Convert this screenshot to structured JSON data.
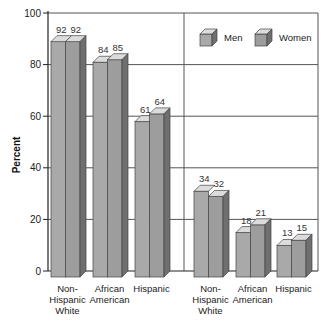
{
  "chart_data": {
    "type": "bar",
    "title": "",
    "xlabel": "",
    "ylabel": "Percent",
    "ylim": [
      0,
      100
    ],
    "yticks": [
      0,
      20,
      40,
      60,
      80,
      100
    ],
    "grid": true,
    "legend_position": "upper right",
    "groups": [
      {
        "name": "group-1",
        "categories": [
          "Non-\nHispanic\nWhite",
          "African\nAmerican",
          "Hispanic"
        ],
        "series": [
          {
            "name": "Men",
            "values": [
              92,
              84,
              61
            ]
          },
          {
            "name": "Women",
            "values": [
              92,
              85,
              64
            ]
          }
        ]
      },
      {
        "name": "group-2",
        "categories": [
          "Non-\nHispanic\nWhite",
          "African\nAmerican",
          "Hispanic"
        ],
        "series": [
          {
            "name": "Men",
            "values": [
              34,
              18,
              13
            ]
          },
          {
            "name": "Women",
            "values": [
              32,
              21,
              15
            ]
          }
        ]
      }
    ],
    "legend": [
      "Men",
      "Women"
    ],
    "colors": {
      "men_front": "#a9a9a9",
      "women_front": "#9d9d9d",
      "top": "#dcdcdc",
      "side": "#6f6f6f",
      "grid": "#555555"
    }
  }
}
